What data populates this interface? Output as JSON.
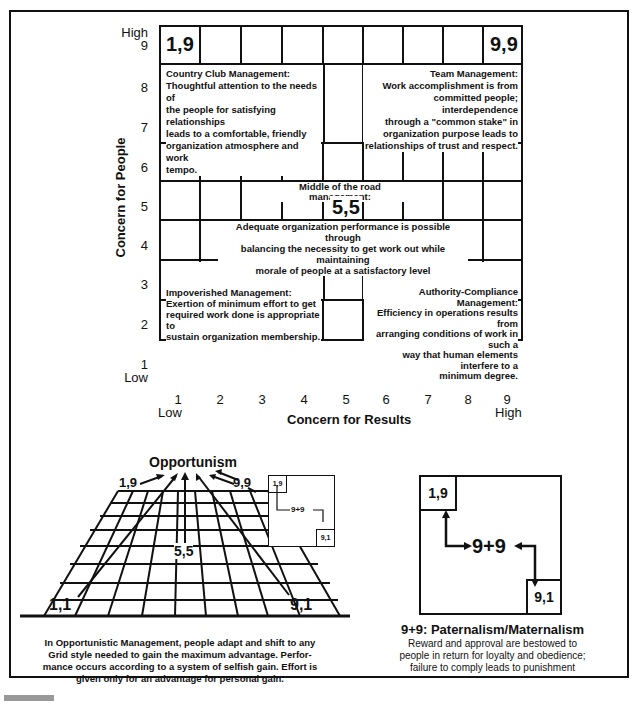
{
  "grid": {
    "y_axis": {
      "label": "Concern for People",
      "ticks": [
        "1",
        "2",
        "3",
        "4",
        "5",
        "6",
        "7",
        "8",
        "9"
      ],
      "high_label": "High",
      "low_label": "Low"
    },
    "x_axis": {
      "label": "Concern for Results",
      "ticks": [
        "1",
        "2",
        "3",
        "4",
        "5",
        "6",
        "7",
        "8",
        "9"
      ],
      "high_label": "High",
      "low_label": "Low"
    },
    "corners": {
      "top_left": "1,9",
      "top_right": "9,9",
      "center": "5,5",
      "bottom_left": "1,1",
      "bottom_right": "9,1"
    },
    "styles": {
      "country_club": {
        "title": "Country Club Management:",
        "lines": [
          "Thoughtful attention to the needs of",
          "the people for satisfying relationships",
          "leads to a comfortable, friendly",
          "organization atmosphere and work",
          "tempo."
        ]
      },
      "team": {
        "title": "Team Management:",
        "lines": [
          "Work accomplishment is from",
          "committed people; interdependence",
          "through a \"common stake\" in",
          "organization purpose leads to",
          "relationships of trust and respect."
        ]
      },
      "middle": {
        "title": "Middle of the road management:",
        "lines": [
          "Adequate organization performance is possible through",
          "balancing the necessity to get work out while maintaining",
          "morale of people at a satisfactory level"
        ]
      },
      "impoverished": {
        "title": "Impoverished Management:",
        "lines": [
          "Exertion of minimum effort to get",
          "required work done is appropriate to",
          "sustain organization membership."
        ]
      },
      "authority": {
        "title": "Authority-Compliance Management:",
        "lines": [
          "Efficiency in operations results from",
          "arranging conditions of work in such a",
          "way that human elements interfere to a",
          "minimum degree."
        ]
      }
    }
  },
  "opportunism": {
    "title": "Opportunism",
    "labels": {
      "p19": "1,9",
      "p99": "9,9",
      "p55": "5,5",
      "p11": "1,1",
      "p91": "9,1"
    },
    "mini": {
      "p19": "1,9",
      "center": "9+9",
      "p91": "9,1"
    },
    "caption": [
      "In Opportunistic Management, people adapt and shift to any",
      "Grid style needed to gain the maximum advantage. Perfor-",
      "mance occurs according to a system of selfish gain. Effort is",
      "given only for an advantage for personal gain."
    ]
  },
  "paternalism": {
    "p19": "1,9",
    "center": "9+9",
    "p91": "9,1",
    "title": "9+9: Paternalism/Maternalism",
    "caption": [
      "Reward and approval are bestowed to",
      "people in return for loyalty and obedience;",
      "failure to comply leads to punishment"
    ]
  }
}
